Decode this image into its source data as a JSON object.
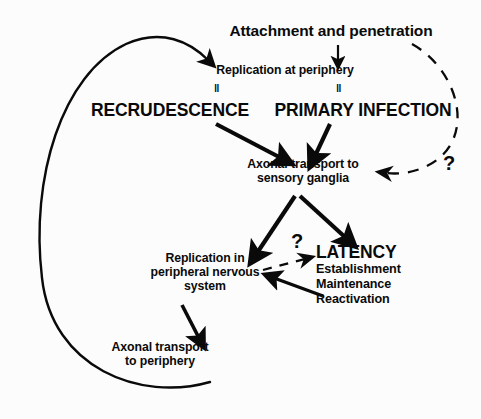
{
  "diagram": {
    "background_color": "#fcfcfc",
    "stroke_color": "#0a0a0a",
    "nodes": {
      "attachment": "Attachment and penetration",
      "replication_periphery": "Replication at periphery",
      "recrudescence": "RECRUDESCENCE",
      "primary_infection": "PRIMARY INFECTION",
      "axonal_to_sensory": "Axonal transport to\nsensory ganglia",
      "replication_pns": "Replication in\nperipheral nervous\nsystem",
      "latency": "LATENCY",
      "latency_sub": "Establishment\nMaintenance\nReactivation",
      "axonal_to_periphery": "Axonal transport\nto periphery"
    },
    "equivalence_marks": {
      "left": "‖",
      "right": "‖"
    },
    "uncertainty_marks": {
      "right": "?",
      "center": "?"
    }
  }
}
